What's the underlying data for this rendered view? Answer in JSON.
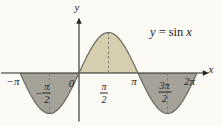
{
  "colors": {
    "background": "#fbfaf5",
    "curve": "#6a675e",
    "axis": "#26241f",
    "dashed_guide": "#817e76",
    "text": "#26241f",
    "region_above_axis": "#d5cfb0",
    "region_below_axis": "#a5a299"
  },
  "figure": {
    "equation": {
      "lhs": "y",
      "equals": "=",
      "fn": "sin",
      "arg": "x"
    },
    "axis_labels": {
      "x": "x",
      "y": "y"
    },
    "ticks": {
      "neg_pi": {
        "text": "−π"
      },
      "neg_pi_over_2": {
        "sign": "−",
        "num": "π",
        "den": "2"
      },
      "zero": {
        "text": "0"
      },
      "pi_over_2": {
        "num": "π",
        "den": "2"
      },
      "pi": {
        "text": "π"
      },
      "three_pi_over_2": {
        "num": "3π",
        "den": "2"
      },
      "two_pi": {
        "text": "2π"
      }
    }
  },
  "chart_data": {
    "type": "line",
    "title": "y = sin x",
    "function": "y = sin(x)",
    "x_domain_pi": [
      -1,
      2
    ],
    "y_range": [
      -1,
      1
    ],
    "x_tick_labels": [
      "−π",
      "−π/2",
      "0",
      "π/2",
      "π",
      "3π/2",
      "2π"
    ],
    "x_tick_values_pi": [
      -1,
      -0.5,
      0,
      0.5,
      1,
      1.5,
      2
    ],
    "key_points_pi": [
      [
        -1,
        0
      ],
      [
        -0.5,
        -1
      ],
      [
        0,
        0
      ],
      [
        0.5,
        1
      ],
      [
        1,
        0
      ],
      [
        1.5,
        -1
      ],
      [
        2,
        0
      ]
    ],
    "dashed_guides_pi": [
      -0.5,
      0.5,
      1.5
    ],
    "shaded_regions": [
      {
        "from_pi": -1,
        "to_pi": 0,
        "position": "below-axis",
        "color": "#a5a299"
      },
      {
        "from_pi": 0,
        "to_pi": 1,
        "position": "above-axis",
        "color": "#d5cfb0"
      },
      {
        "from_pi": 1,
        "to_pi": 2,
        "position": "below-axis",
        "color": "#a5a299"
      }
    ],
    "axis_labels": {
      "x": "x",
      "y": "y"
    },
    "grid": false,
    "legend": null
  }
}
